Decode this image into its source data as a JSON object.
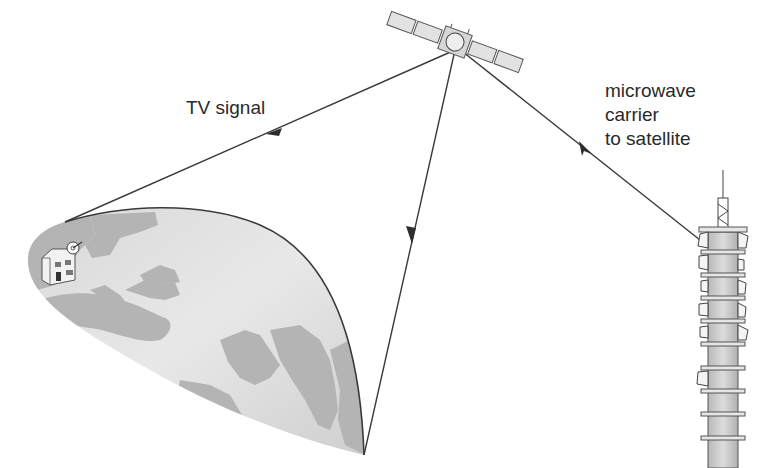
{
  "labels": {
    "tv_signal": "TV signal",
    "uplink": [
      "microwave",
      "carrier",
      "to satellite"
    ]
  },
  "elements": {
    "satellite": "communications satellite with solar panels",
    "earth": "globe section showing Europe, Africa, Middle East and India",
    "house": "house with satellite dish receiver",
    "tower": "microwave transmission tower with dish antennas"
  },
  "colors": {
    "line": "#3a3a3a",
    "ocean": "#e4e4e4",
    "land": "#b4b4b4",
    "tower_body": "#cfcfcf",
    "text": "#2a2a2a"
  }
}
